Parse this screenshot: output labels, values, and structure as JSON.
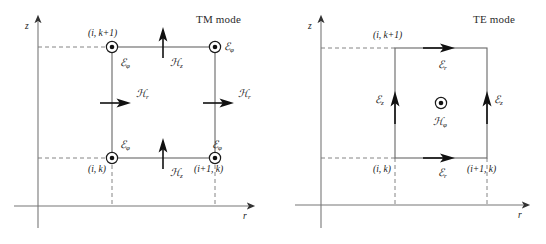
{
  "figure": {
    "type": "two-panel-diagram",
    "background_color": "#ffffff",
    "line_color": "#555555",
    "arrow_color": "#111111",
    "text_color": "#1a1a1a"
  },
  "panels": [
    {
      "id": "tm",
      "title": "TM mode",
      "axes": {
        "vertical_label": "z",
        "horizontal_label": "r",
        "origin_x": 38,
        "origin_y": 206
      },
      "cell": {
        "left_x": 112,
        "right_x": 215,
        "top_y": 47,
        "bottom_y": 158
      },
      "nodes": [
        {
          "name": "top-left",
          "label": "(i, k+1)",
          "marker": "circle-dot",
          "field": "E-phi"
        },
        {
          "name": "top-right",
          "label": "",
          "marker": "circle-dot",
          "field": "E-phi"
        },
        {
          "name": "bottom-left",
          "label": "(i, k)",
          "marker": "circle-dot",
          "field": "E-phi"
        },
        {
          "name": "bottom-right",
          "label": "(i+1, k)",
          "marker": "circle-dot",
          "field": "E-phi"
        }
      ],
      "field_labels": [
        {
          "symbol": "E",
          "sub": "φ",
          "name": "e-phi-top-left"
        },
        {
          "symbol": "E",
          "sub": "φ",
          "name": "e-phi-top-right"
        },
        {
          "symbol": "E",
          "sub": "φ",
          "name": "e-phi-bottom-left"
        },
        {
          "symbol": "E",
          "sub": "φ",
          "name": "e-phi-bottom-right"
        },
        {
          "symbol": "H",
          "sub": "z",
          "name": "h-z-top"
        },
        {
          "symbol": "H",
          "sub": "z",
          "name": "h-z-bottom"
        },
        {
          "symbol": "H",
          "sub": "r",
          "name": "h-r-left"
        },
        {
          "symbol": "H",
          "sub": "r",
          "name": "h-r-right"
        }
      ],
      "arrows": [
        {
          "name": "h-z-top-arrow",
          "direction": "up",
          "x": 163,
          "y": 47
        },
        {
          "name": "h-z-bottom-arrow",
          "direction": "up",
          "x": 163,
          "y": 158
        },
        {
          "name": "h-r-left-arrow",
          "direction": "right",
          "x": 112,
          "y": 103
        },
        {
          "name": "h-r-right-arrow",
          "direction": "right",
          "x": 215,
          "y": 103
        }
      ]
    },
    {
      "id": "te",
      "title": "TE mode",
      "axes": {
        "vertical_label": "z",
        "horizontal_label": "r",
        "origin_x": 48,
        "origin_y": 205
      },
      "cell": {
        "left_x": 122,
        "right_x": 214,
        "top_y": 48,
        "bottom_y": 158
      },
      "nodes": [
        {
          "name": "top-left",
          "label": "(i, k+1)",
          "marker": "none"
        },
        {
          "name": "bottom-left",
          "label": "(i, k)",
          "marker": "none"
        },
        {
          "name": "bottom-right",
          "label": "(i+1, k)",
          "marker": "none"
        }
      ],
      "center_marker": {
        "name": "h-phi-marker",
        "marker": "circle-dot",
        "x": 168,
        "y": 103
      },
      "field_labels": [
        {
          "symbol": "E",
          "sub": "r",
          "name": "e-r-top"
        },
        {
          "symbol": "E",
          "sub": "r",
          "name": "e-r-bottom"
        },
        {
          "symbol": "E",
          "sub": "z",
          "name": "e-z-left"
        },
        {
          "symbol": "E",
          "sub": "z",
          "name": "e-z-right"
        },
        {
          "symbol": "H",
          "sub": "φ",
          "name": "h-phi-center"
        }
      ],
      "arrows": [
        {
          "name": "e-r-top-arrow",
          "direction": "right",
          "x": 168,
          "y": 48
        },
        {
          "name": "e-r-bottom-arrow",
          "direction": "right",
          "x": 168,
          "y": 158
        },
        {
          "name": "e-z-left-arrow",
          "direction": "up",
          "x": 122,
          "y": 103
        },
        {
          "name": "e-z-right-arrow",
          "direction": "up",
          "x": 214,
          "y": 103
        }
      ]
    }
  ],
  "symbols": {
    "script_e": "ℰ",
    "script_h": "ℋ",
    "phi": "φ",
    "r": "r",
    "z": "z"
  }
}
